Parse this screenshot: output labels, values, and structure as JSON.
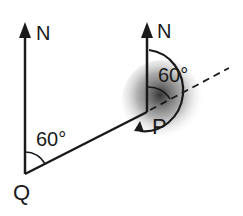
{
  "diagram": {
    "type": "bearing-diagram",
    "points": {
      "Q": {
        "label": "Q"
      },
      "P": {
        "label": "P"
      }
    },
    "north_labels": [
      "N",
      "N"
    ],
    "angles": [
      {
        "at": "Q",
        "label": "60°",
        "between": "north and QP"
      },
      {
        "at": "P",
        "label": "60°",
        "between": "north and extension of QP"
      }
    ],
    "colors": {
      "line": "#1a1a1a",
      "shade": "#555555",
      "background": "#ffffff"
    }
  }
}
